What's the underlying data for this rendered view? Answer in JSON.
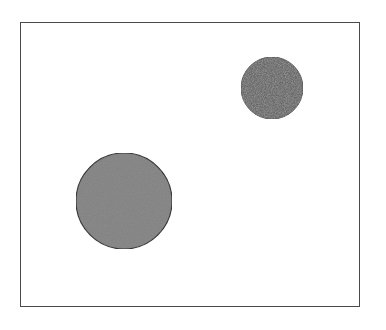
{
  "figure": {
    "width": 386,
    "height": 330,
    "frame": {
      "x": 20,
      "y": 22,
      "width": 340,
      "height": 285,
      "stroke": "#4a4a4a",
      "fill": "#ffffff"
    },
    "shapes": [
      {
        "name": "large-light-circle",
        "type": "circle",
        "cx": 124,
        "cy": 201,
        "r": 48,
        "fill": "#8c8c8c",
        "stroke": "#3a3a3a",
        "texture": "noise"
      },
      {
        "name": "small-dark-circle",
        "type": "circle",
        "cx": 272,
        "cy": 88,
        "r": 31,
        "fill": "#555555",
        "stroke": "#333333",
        "texture": "noise"
      }
    ]
  }
}
